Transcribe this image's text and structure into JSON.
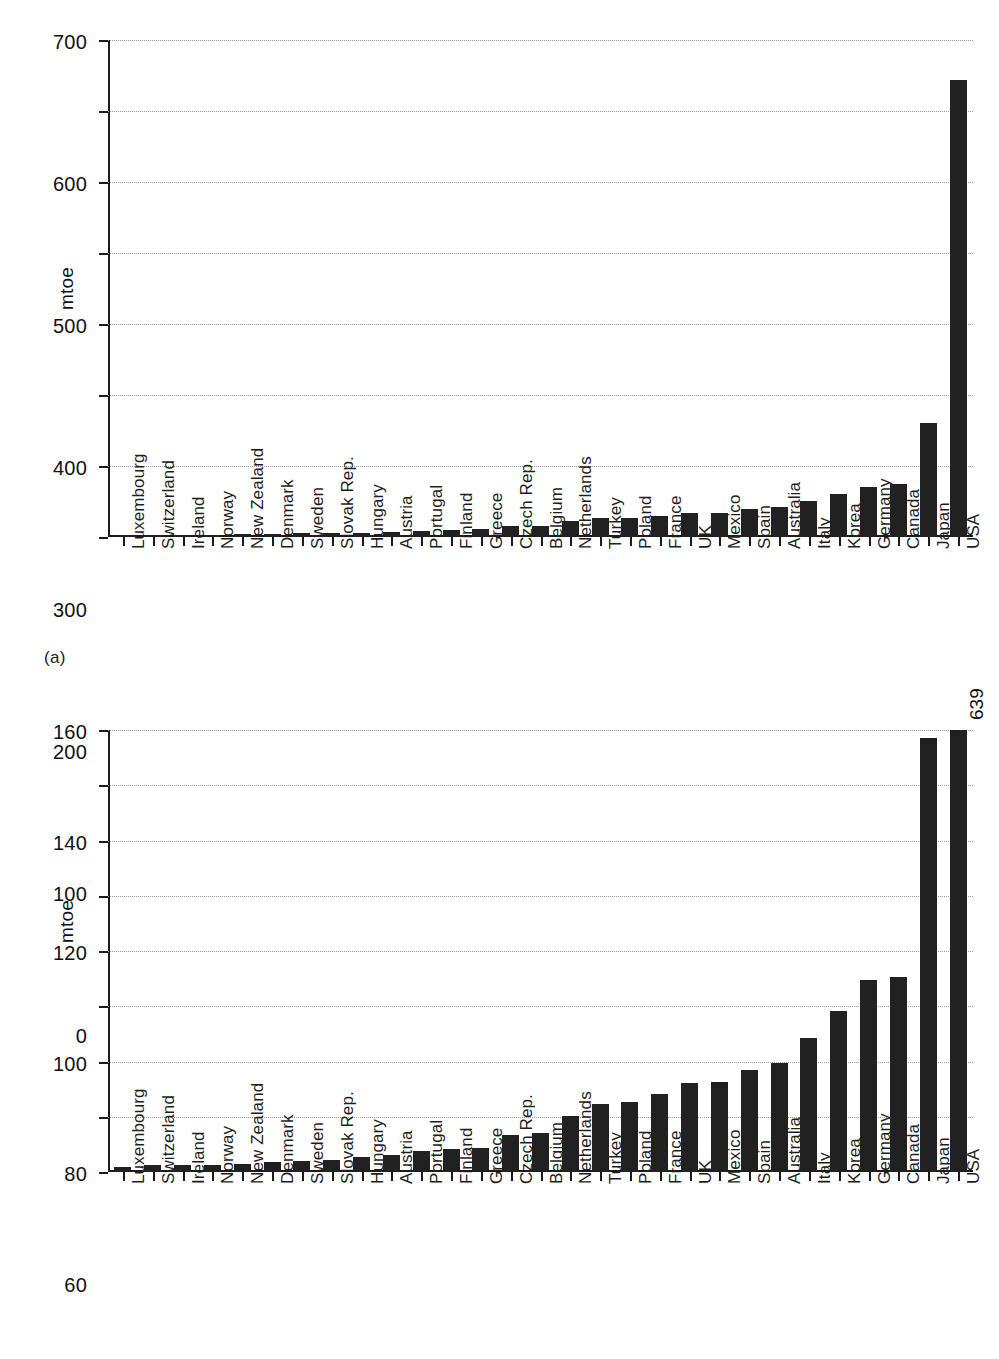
{
  "figure": {
    "panel_a_tag": "(a)",
    "panel_b_tag": "(b)"
  },
  "chart_data": [
    {
      "panel": "(a)",
      "type": "bar",
      "title": "",
      "xlabel": "",
      "ylabel": "mtoe",
      "ylim": [
        0,
        700
      ],
      "yticks": [
        0,
        100,
        200,
        300,
        400,
        500,
        600,
        700
      ],
      "grid": true,
      "legend": "none",
      "bar_color": "#212121",
      "categories": [
        "Luxembourg",
        "Switzerland",
        "Ireland",
        "Norway",
        "New Zealand",
        "Denmark",
        "Sweden",
        "Slovak Rep.",
        "Hungary",
        "Austria",
        "Portugal",
        "Finland",
        "Greece",
        "Czech Rep.",
        "Belgium",
        "Netherlands",
        "Turkey",
        "Poland",
        "France",
        "UK",
        "Mexico",
        "Spain",
        "Australia",
        "Italy",
        "Korea",
        "Germany",
        "Canada",
        "Japan",
        "USA"
      ],
      "values": [
        3,
        3,
        3,
        3,
        4,
        4,
        5,
        5,
        6,
        7,
        9,
        10,
        11,
        15,
        16,
        22,
        27,
        27,
        30,
        34,
        34,
        39,
        42,
        51,
        60,
        71,
        75,
        160,
        643
      ]
    },
    {
      "panel": "(b)",
      "type": "bar",
      "title": "",
      "xlabel": "",
      "ylabel": "mtoe",
      "ylim": [
        0,
        160
      ],
      "yticks": [
        0,
        20,
        40,
        60,
        80,
        100,
        120,
        140,
        160
      ],
      "grid": true,
      "legend": "none",
      "bar_color": "#212121",
      "clipped_bars": [
        {
          "category": "USA",
          "annotation": "639"
        }
      ],
      "categories": [
        "Luxembourg",
        "Switzerland",
        "Ireland",
        "Norway",
        "New Zealand",
        "Denmark",
        "Sweden",
        "Slovak Rep.",
        "Hungary",
        "Austria",
        "Portugal",
        "Finland",
        "Greece",
        "Czech Rep.",
        "Belgium",
        "Netherlands",
        "Turkey",
        "Poland",
        "France",
        "UK",
        "Mexico",
        "Spain",
        "Australia",
        "Italy",
        "Korea",
        "Germany",
        "Canada",
        "Japan",
        "USA"
      ],
      "values": [
        1.8,
        2.4,
        2.4,
        2.4,
        2.8,
        3.6,
        4.0,
        4.2,
        5.6,
        6.2,
        7.5,
        8.2,
        8.8,
        13.4,
        14.2,
        20.4,
        24.8,
        25.4,
        28.4,
        32.2,
        32.6,
        37.0,
        39.4,
        48.6,
        58.4,
        69.4,
        70.6,
        157.0,
        639
      ]
    }
  ]
}
